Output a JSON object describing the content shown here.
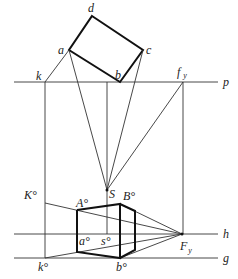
{
  "diagram": {
    "type": "perspective-construction",
    "colors": {
      "line": "#333333",
      "thick_line": "#111111",
      "background": "#ffffff"
    },
    "lines": {
      "p": {
        "label": "p"
      },
      "h": {
        "label": "h"
      },
      "g": {
        "label": "g"
      }
    },
    "plan_points": {
      "d": "d",
      "a": "a",
      "c": "c",
      "b": "b",
      "k": "k",
      "fy_main": "f",
      "fy_sub": "y"
    },
    "perspective_points": {
      "S": "S",
      "K0": "K°",
      "A0": "A°",
      "B0": "B°",
      "a0": "a°",
      "s0": "s°",
      "Fy_main": "F",
      "Fy_sub": "y",
      "k0": "k°",
      "b0": "b°"
    }
  }
}
